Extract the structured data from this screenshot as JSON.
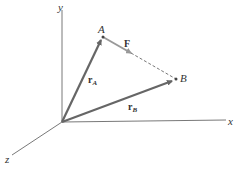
{
  "labels": {
    "y_axis": "y",
    "x_axis": "x",
    "z_axis": "z",
    "point_a": "A",
    "point_b": "B",
    "force": "F",
    "r_a_main": "r",
    "r_a_sub": "A",
    "r_b_main": "r",
    "r_b_sub": "B"
  },
  "colors": {
    "axis": "#555555",
    "position_vector": "#666666",
    "force_vector": "#999999",
    "dashed": "#555555"
  }
}
